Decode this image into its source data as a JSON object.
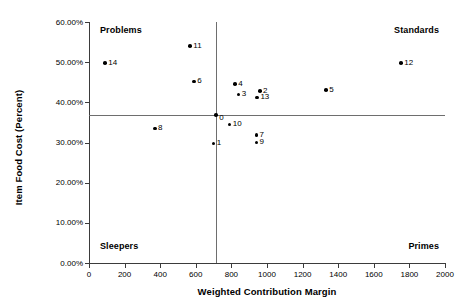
{
  "chart_data": {
    "type": "scatter",
    "title": "",
    "xlabel": "Weighted Contribution Margin",
    "ylabel": "Item Food Cost (Percent)",
    "xlim": [
      0,
      2000
    ],
    "ylim": [
      0,
      0.6
    ],
    "grid": false,
    "legend": "none",
    "xticks": [
      "0",
      "200",
      "400",
      "600",
      "800",
      "1000",
      "1200",
      "1400",
      "1600",
      "1800",
      "2000"
    ],
    "xtick_values": [
      0,
      200,
      400,
      600,
      800,
      1000,
      1200,
      1400,
      1600,
      1800,
      2000
    ],
    "yticks": [
      "0.00%",
      "10.00%",
      "20.00%",
      "30.00%",
      "40.00%",
      "50.00%",
      "60.00%"
    ],
    "ytick_values": [
      0,
      10,
      20,
      30,
      40,
      50,
      60
    ],
    "quadrant_lines": {
      "vertical_x": 714,
      "horizontal_y": 36.8
    },
    "quadrant_labels": [
      {
        "label": "Problems",
        "quadrant": "top-left"
      },
      {
        "label": "Standards",
        "quadrant": "top-right"
      },
      {
        "label": "Sleepers",
        "quadrant": "bottom-left"
      },
      {
        "label": "Primes",
        "quadrant": "bottom-right"
      }
    ],
    "points": [
      {
        "label": "14",
        "x": 90,
        "y": 49.8
      },
      {
        "label": "11",
        "x": 568,
        "y": 54.0
      },
      {
        "label": "6",
        "x": 590,
        "y": 45.2
      },
      {
        "label": "8",
        "x": 370,
        "y": 33.5
      },
      {
        "label": "1",
        "x": 700,
        "y": 29.8
      },
      {
        "label": "4",
        "x": 820,
        "y": 44.5
      },
      {
        "label": "3",
        "x": 840,
        "y": 42.0
      },
      {
        "label": "2",
        "x": 960,
        "y": 42.8
      },
      {
        "label": "13",
        "x": 945,
        "y": 41.2
      },
      {
        "label": "10",
        "x": 790,
        "y": 34.5
      },
      {
        "label": "7",
        "x": 940,
        "y": 31.8
      },
      {
        "label": "9",
        "x": 940,
        "y": 30.0
      },
      {
        "label": "5",
        "x": 1332,
        "y": 43.0
      },
      {
        "label": "12",
        "x": 1753,
        "y": 49.8
      }
    ],
    "origin_marker": {
      "label": "0",
      "x": 714,
      "y": 36.8
    }
  },
  "colors": {
    "axis": "#3b3b3b",
    "quadrant_line": "#6e6e6e",
    "point": "#000000",
    "text": "#000000",
    "background": "#ffffff"
  }
}
